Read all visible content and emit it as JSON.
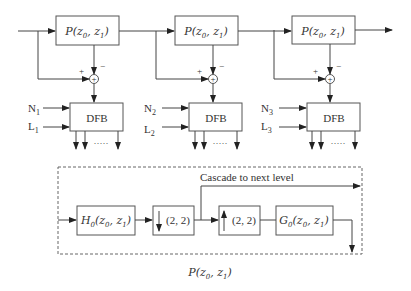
{
  "stages": [
    {
      "p_block": "P(z0, z1)",
      "plus": "+",
      "minus": "−",
      "n_label": "N",
      "n_sub": "1",
      "l_label": "L",
      "l_sub": "1",
      "dfb_label": "DFB",
      "dots": "·····"
    },
    {
      "p_block": "P(z0, z1)",
      "plus": "+",
      "minus": "−",
      "n_label": "N",
      "n_sub": "2",
      "l_label": "L",
      "l_sub": "2",
      "dfb_label": "DFB",
      "dots": "·····"
    },
    {
      "p_block": "P(z0, z1)",
      "plus": "+",
      "minus": "−",
      "n_label": "N",
      "n_sub": "3",
      "l_label": "L",
      "l_sub": "3",
      "dfb_label": "DFB",
      "dots": "·····"
    }
  ],
  "detail": {
    "h0_block": "H0(z0, z1)",
    "down_block": "(2, 2)",
    "up_block": "(2, 2)",
    "g0_block": "G0(z0, z1)",
    "cascade_label": "Cascade to next level",
    "caption": "P(z0, z1)"
  }
}
